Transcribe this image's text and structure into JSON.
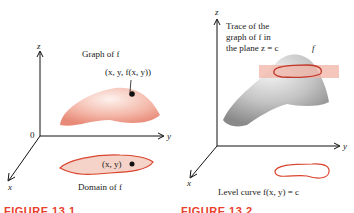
{
  "left_figure": {
    "axis_labels": {
      "z": "z",
      "y": "y",
      "x": "x",
      "origin": "0"
    },
    "graph_label": "Graph of f",
    "point_label": "(x, y, f(x, y))",
    "domain_point_label": "(x, y)",
    "domain_label": "Domain of f",
    "caption": "FIGURE 13.1"
  },
  "right_figure": {
    "axis_labels": {
      "z": "z",
      "y": "y",
      "x": "x"
    },
    "trace_label_lines": [
      "Trace of the",
      "graph of f in",
      "the plane z = c"
    ],
    "surface_label": "f",
    "level_curve_label": "Level curve f(x, y) = c",
    "caption": "FIGURE 13.2"
  },
  "colors": {
    "surface_pink": "#f2b3a6",
    "domain_fill": "#f5d3c8",
    "curve_red": "#d9452f",
    "surface_gray": "#b8b8b8",
    "caption_red": "#e8402c"
  }
}
